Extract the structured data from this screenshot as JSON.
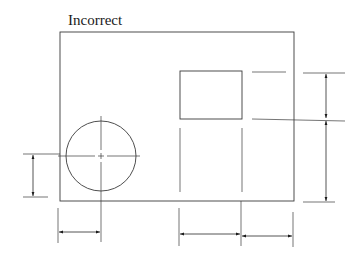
{
  "figure": {
    "title": "Incorrect",
    "colors": {
      "line": "#3a3a3a",
      "arrow": "#1a1a1a",
      "background": "#ffffff"
    },
    "outline_rect": {
      "x1": 60,
      "y1": 32,
      "x2": 294,
      "y2": 201
    },
    "circle": {
      "cx": 101,
      "cy": 156,
      "r": 35
    },
    "small_rect": {
      "x1": 180,
      "y1": 71,
      "x2": 242,
      "y2": 119
    },
    "dimensions": {
      "left_vertical": {
        "x": 33,
        "y1": 154,
        "y2": 197,
        "label": ""
      },
      "right_vertical_upper": {
        "x": 326,
        "y1": 73,
        "y2": 119,
        "label": ""
      },
      "right_vertical_lower": {
        "x": 326,
        "y1": 119,
        "y2": 201,
        "label": ""
      },
      "bottom_left": {
        "y": 232,
        "x1": 58,
        "x2": 100,
        "label": ""
      },
      "bottom_mid": {
        "y": 234,
        "x1": 179,
        "x2": 241,
        "label": ""
      },
      "bottom_right": {
        "y": 236,
        "x1": 241,
        "x2": 293,
        "label": ""
      }
    }
  }
}
